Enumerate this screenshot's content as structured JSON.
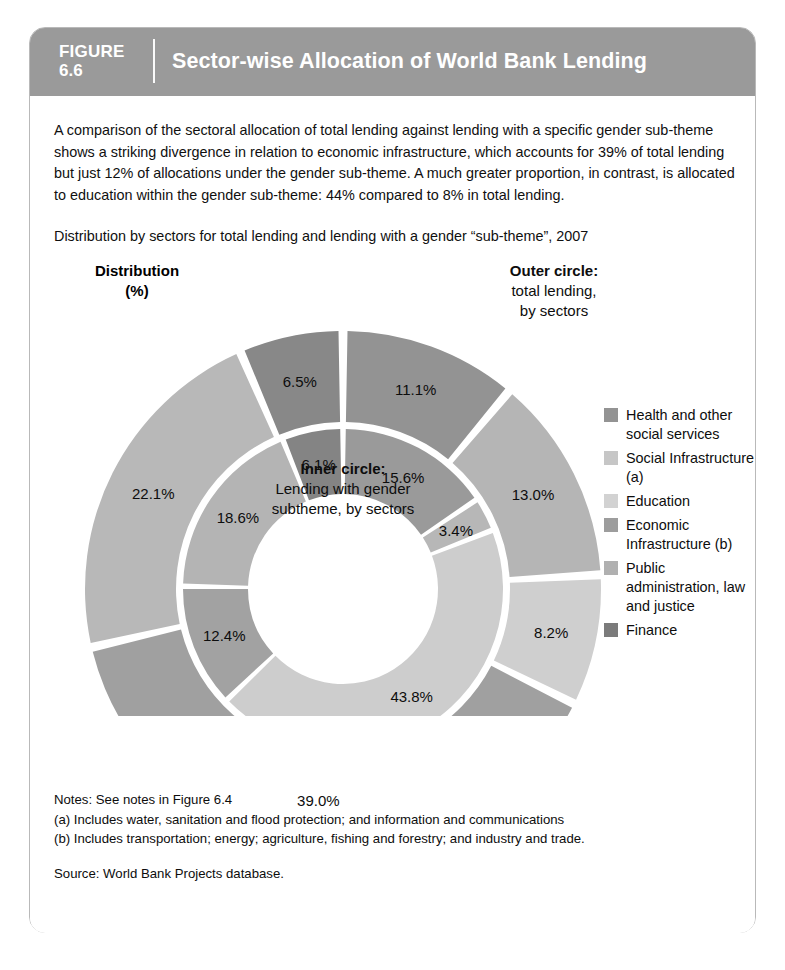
{
  "figure": {
    "label": "FIGURE",
    "number": "6.6",
    "title": "Sector-wise Allocation of World Bank Lending"
  },
  "intro": {
    "paragraph": "A comparison of the sectoral allocation of total lending against lending with a specific gender sub-theme shows a striking divergence in relation to economic infrastructure, which accounts for 39% of total lending but just 12% of allocations under the gender sub-theme. A much greater proportion, in contrast, is allocated to education within the gender sub-theme: 44% compared to 8% in total lending.",
    "subtitle": "Distribution by sectors for total lending and lending with a gender “sub-theme”, 2007"
  },
  "annotations": {
    "distribution_line1": "Distribution",
    "distribution_line2": "(%)",
    "outer_title": "Outer circle:",
    "outer_line1": "total lending,",
    "outer_line2": "by sectors",
    "inner_title": "Inner circle:",
    "inner_line1": "Lending with gender",
    "inner_line2": "subtheme, by sectors"
  },
  "legend": {
    "items": [
      {
        "label": "Health and other social services",
        "color": "#939393"
      },
      {
        "label": "Social Infrastructure (a)",
        "color": "#c6c6c6"
      },
      {
        "label": "Education",
        "color": "#d2d2d2"
      },
      {
        "label": "Economic Infrastructure (b)",
        "color": "#9d9d9d"
      },
      {
        "label": "Public administration, law and justice",
        "color": "#b0b0b0"
      },
      {
        "label": "Finance",
        "color": "#7b7b7b"
      }
    ]
  },
  "notes": {
    "line1": "Notes: See notes in Figure 6.4",
    "line2": "(a) Includes water, sanitation and flood protection; and information and communications",
    "line3": "(b) Includes transportation; energy; agriculture, fishing and forestry; and industry and trade.",
    "source": "Source: World Bank Projects database."
  },
  "chart_data": {
    "type": "pie",
    "title": "Sector-wise Allocation of World Bank Lending",
    "subtitle": "Distribution by sectors for total lending and lending with a gender “sub-theme”, 2007",
    "unit": "percent",
    "legend_position": "right",
    "start_angle_deg": 0,
    "direction": "clockwise",
    "rings": [
      {
        "name": "Outer circle: total lending, by sectors",
        "ring": "outer",
        "inner_radius": 167,
        "outer_radius": 258,
        "slices": [
          {
            "label": "Health and other social services",
            "value": 11.1,
            "display": "11.1%",
            "color": "#939393"
          },
          {
            "label": "Social Infrastructure (a)",
            "value": 13.0,
            "display": "13.0%",
            "color": "#b5b5b5"
          },
          {
            "label": "Education",
            "value": 8.2,
            "display": "8.2%",
            "color": "#cfcfcf"
          },
          {
            "label": "Economic Infrastructure (b)",
            "value": 39.0,
            "display": "39.0%",
            "color": "#a0a0a0"
          },
          {
            "label": "Public administration, law and justice",
            "value": 22.1,
            "display": "22.1%",
            "color": "#b8b8b8"
          },
          {
            "label": "Finance",
            "value": 6.5,
            "display": "6.5%",
            "color": "#888888"
          }
        ]
      },
      {
        "name": "Inner circle: lending with gender subtheme, by sectors",
        "ring": "inner",
        "inner_radius": 95,
        "outer_radius": 160,
        "slices": [
          {
            "label": "Health and other social services",
            "value": 15.6,
            "display": "15.6%",
            "color": "#9a9a9a"
          },
          {
            "label": "Social Infrastructure (a)",
            "value": 3.4,
            "display": "3.4%",
            "color": "#b7b7b7"
          },
          {
            "label": "Education",
            "value": 43.8,
            "display": "43.8%",
            "color": "#cdcdcd"
          },
          {
            "label": "Economic Infrastructure (b)",
            "value": 12.4,
            "display": "12.4%",
            "color": "#a2a2a2"
          },
          {
            "label": "Public administration, law and justice",
            "value": 18.6,
            "display": "18.6%",
            "color": "#b4b4b4"
          },
          {
            "label": "Finance",
            "value": 6.1,
            "display": "6.1%",
            "color": "#848484"
          }
        ]
      }
    ]
  }
}
